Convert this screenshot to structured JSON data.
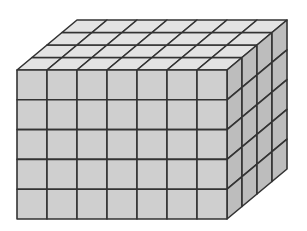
{
  "diagram": {
    "type": "rectangular-prism-of-unit-cubes",
    "dimensions": {
      "length": 7,
      "height": 5,
      "depth": 4
    },
    "total_cubes": 140,
    "geometry": {
      "front_origin": [
        17,
        70
      ],
      "cell_width": 30,
      "cell_height": 29.8,
      "depth_step": [
        15,
        -12.5
      ]
    },
    "colors": {
      "background": "#ffffff",
      "front_face": "#cfcfcf",
      "top_face": "#e3e3e3",
      "right_face": "#bdbdbd",
      "grid_line": "#333333"
    },
    "labels": {
      "caption": "Rectangular prism built from 7 × 5 × 4 unit cubes"
    }
  }
}
